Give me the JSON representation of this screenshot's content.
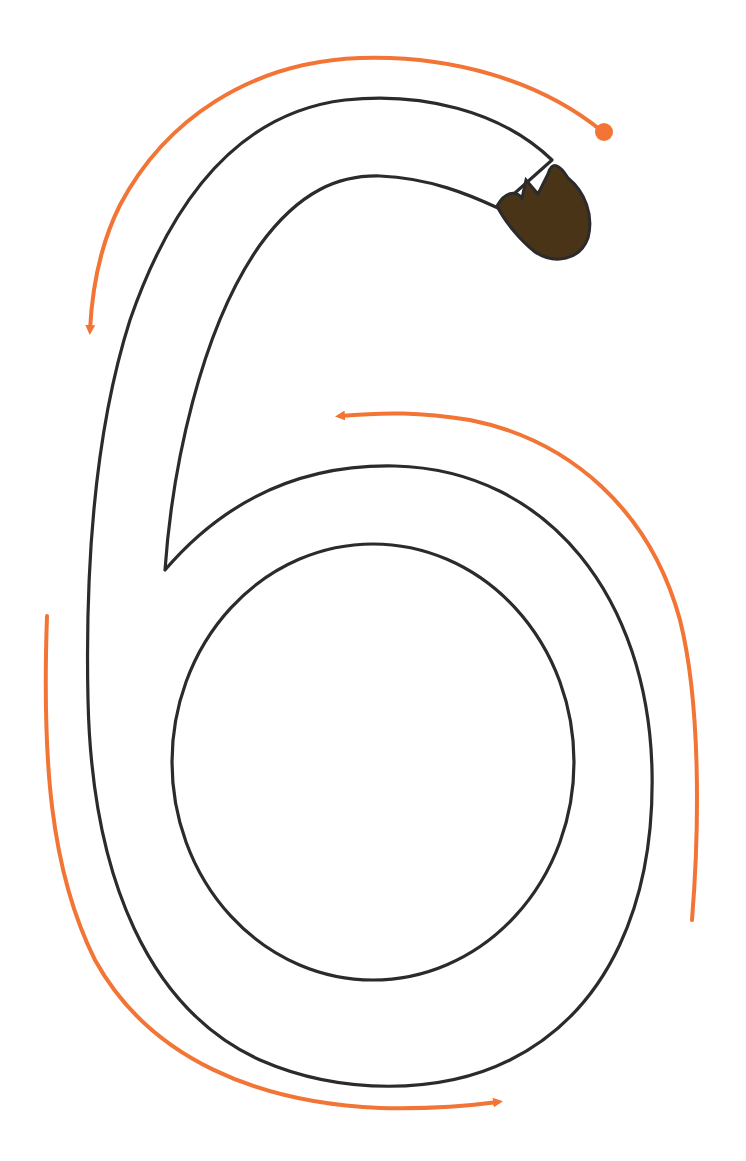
{
  "worksheet": {
    "subject": "number tracing",
    "digit": "6",
    "colors": {
      "background": "#ffffff",
      "outline": "#2b2b2b",
      "start_blob": "#4a3418",
      "guide_arrows": "#f37535"
    },
    "guides": [
      {
        "id": "guide-top-arc",
        "description": "start dot upper right, arcs over the top and down the left side",
        "direction": "counter-clockwise, ends with arrowhead pointing down"
      },
      {
        "id": "guide-left-lower",
        "description": "down the left side and around the bottom",
        "direction": "ends with arrowhead pointing right"
      },
      {
        "id": "guide-right-loop",
        "description": "up the right side of the loop and over the top",
        "direction": "ends with arrowhead pointing left"
      }
    ]
  }
}
